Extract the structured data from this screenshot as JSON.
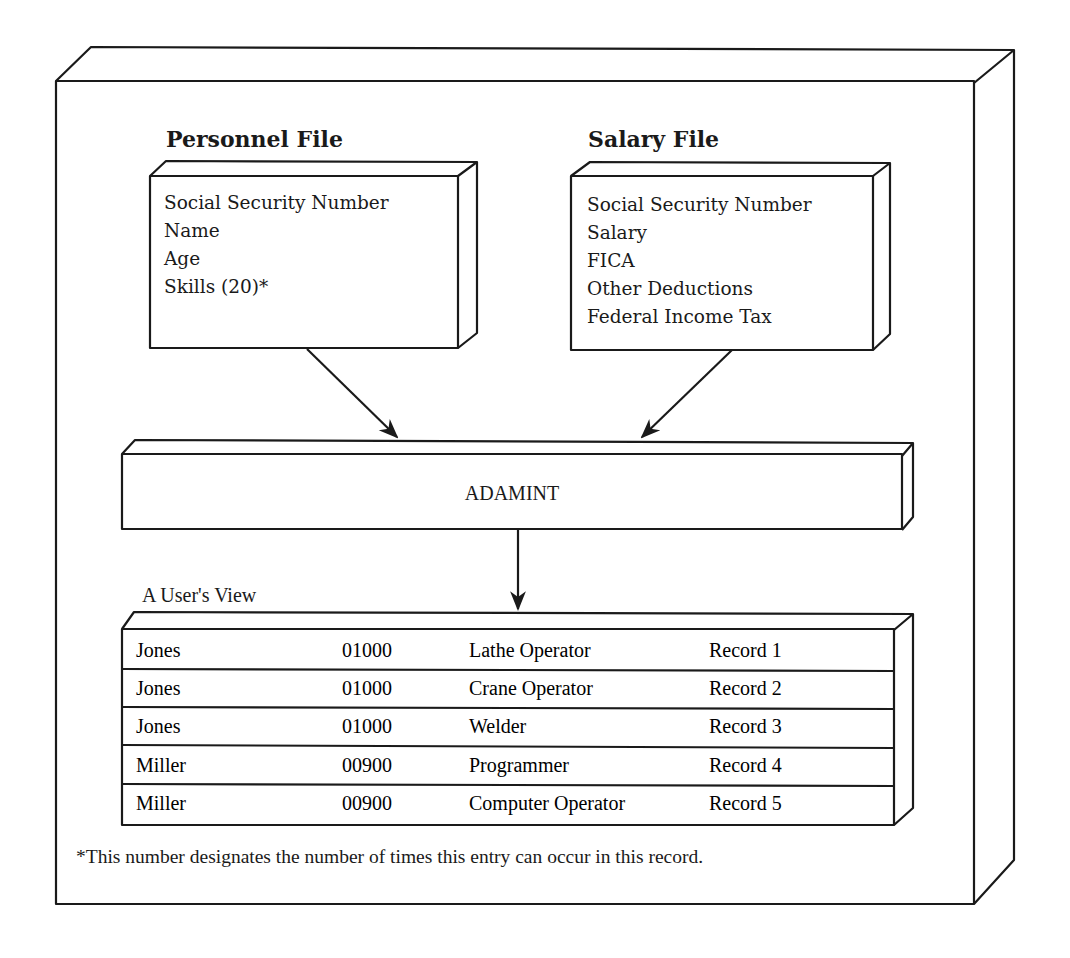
{
  "personnel_file": {
    "title": "Personnel File",
    "fields": [
      "Social Security Number",
      "Name",
      "Age",
      "Skills (20)*"
    ]
  },
  "salary_file": {
    "title": "Salary File",
    "fields": [
      "Social Security Number",
      "Salary",
      "FICA",
      "Other Deductions",
      "Federal Income Tax"
    ]
  },
  "interface": {
    "label": "ADAMINT"
  },
  "user_view": {
    "label": "A User's View",
    "rows": [
      {
        "name": "Jones",
        "salary": "01000",
        "skill": "Lathe Operator",
        "record": "Record 1"
      },
      {
        "name": "Jones",
        "salary": "01000",
        "skill": "Crane Operator",
        "record": "Record 2"
      },
      {
        "name": "Jones",
        "salary": "01000",
        "skill": "Welder",
        "record": "Record 3"
      },
      {
        "name": "Miller",
        "salary": "00900",
        "skill": "Programmer",
        "record": "Record 4"
      },
      {
        "name": "Miller",
        "salary": "00900",
        "skill": "Computer Operator",
        "record": "Record 5"
      }
    ]
  },
  "footnote": "*This number designates the number of times this entry can occur in this record."
}
